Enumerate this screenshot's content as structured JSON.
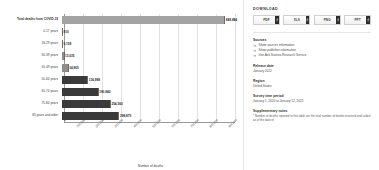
{
  "chart_data": {
    "type": "bar",
    "orientation": "horizontal",
    "title": "",
    "xlabel": "Number of deaths",
    "ylabel": "",
    "grid": true,
    "legend": "none",
    "xlim": [
      0,
      900000
    ],
    "xticks": [
      "0",
      "100,000",
      "200,000",
      "300,000",
      "400,000",
      "500,000",
      "600,000",
      "700,000",
      "800,000",
      "900,000"
    ],
    "categories": [
      "Total deaths from COVID-19",
      "0-17 years",
      "18-29 years",
      "30-39 years",
      "40-49 years",
      "50-64 years",
      "65-74 years",
      "75-84 years",
      "85 years and older"
    ],
    "values": [
      849884,
      810,
      5159,
      13035,
      34905,
      136998,
      190840,
      254560,
      298875
    ],
    "value_labels": [
      "849,884",
      "810",
      "5,159",
      "13,035",
      "34,905",
      "136,998",
      "190,840",
      "254,560",
      "298,875"
    ]
  },
  "sidebar": {
    "download_title": "DOWNLOAD",
    "download_buttons": [
      {
        "label": "PDF",
        "name": "download-pdf-button"
      },
      {
        "label": "XLS",
        "name": "download-xls-button"
      },
      {
        "label": "PNG",
        "name": "download-png-button"
      },
      {
        "label": "PPT",
        "name": "download-ppt-button"
      }
    ],
    "sources_title": "Sources",
    "source_links": [
      "Show sources information",
      "Show publisher information",
      "Use Ask Statista Research Service"
    ],
    "release_date_title": "Release date",
    "release_date_value": "January 2022",
    "region_title": "Region",
    "region_value": "United States",
    "survey_title": "Survey time period",
    "survey_value": "January 1, 2020 to January 12, 2022",
    "notes_title": "Supplementary notes",
    "notes_value": "* Number of deaths reported in this table are the total number of deaths received and coded as of the date of"
  },
  "colors": {
    "bar_light": "#8e8e8e",
    "bar_total": "#a3a3a3",
    "bar_dark": "#3a3a3a",
    "grid": "#e2e2e2",
    "tab_dark": "#2c2c2c"
  }
}
